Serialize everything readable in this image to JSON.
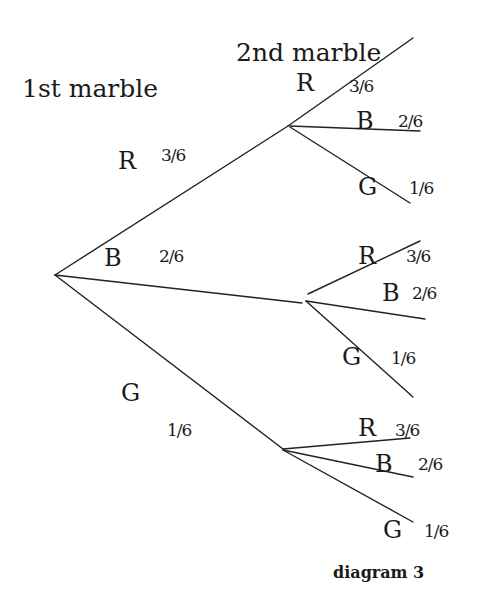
{
  "headings": {
    "first": "1st marble",
    "second": "2nd marble"
  },
  "caption": "diagram 3",
  "first_draw": [
    {
      "label": "R",
      "prob": "3/6"
    },
    {
      "label": "B",
      "prob": "2/6"
    },
    {
      "label": "G",
      "prob": "1/6"
    }
  ],
  "second_draw": {
    "after_R": [
      {
        "label": "R",
        "prob": "3/6"
      },
      {
        "label": "B",
        "prob": "2/6"
      },
      {
        "label": "G",
        "prob": "1/6"
      }
    ],
    "after_B": [
      {
        "label": "R",
        "prob": "3/6"
      },
      {
        "label": "B",
        "prob": "2/6"
      },
      {
        "label": "G",
        "prob": "1/6"
      }
    ],
    "after_G": [
      {
        "label": "R",
        "prob": "3/6"
      },
      {
        "label": "B",
        "prob": "2/6"
      },
      {
        "label": "G",
        "prob": "1/6"
      }
    ]
  },
  "style": {
    "line_color": "#222222",
    "text_color": "#1a1a1a",
    "background": "#ffffff"
  }
}
